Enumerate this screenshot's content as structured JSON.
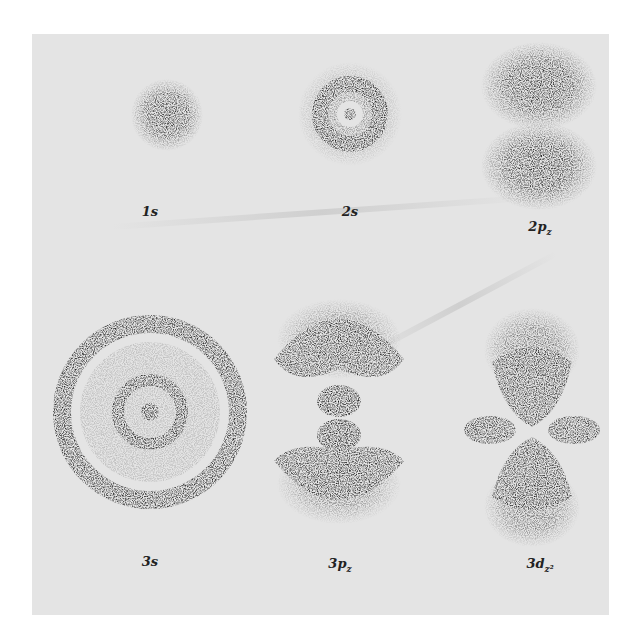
{
  "figure": {
    "type": "hydrogen atomic orbital electron density plots",
    "background_color": "#e4e4e4",
    "ink_color": "#1e1e1e",
    "orbitals": [
      {
        "id": "1s",
        "label_main": "1",
        "label_sub": "s",
        "label": "1s",
        "shape": "single diffuse sphere"
      },
      {
        "id": "2s",
        "label_main": "2",
        "label_sub": "s",
        "label": "2s",
        "shape": "core plus one ring"
      },
      {
        "id": "2pz",
        "label_main": "2p",
        "label_sub": "z",
        "label": "2pz",
        "shape": "two lobes along vertical axis"
      },
      {
        "id": "3s",
        "label_main": "3",
        "label_sub": "s",
        "label": "3s",
        "shape": "core plus two rings"
      },
      {
        "id": "3pz",
        "label_main": "3p",
        "label_sub": "z",
        "label": "3pz",
        "shape": "two inner lobes plus two outer crescents"
      },
      {
        "id": "3dz2",
        "label_main": "3d",
        "label_sub": "z²",
        "label": "3dz²",
        "shape": "two vertical lobes plus horizontal torus"
      }
    ]
  }
}
